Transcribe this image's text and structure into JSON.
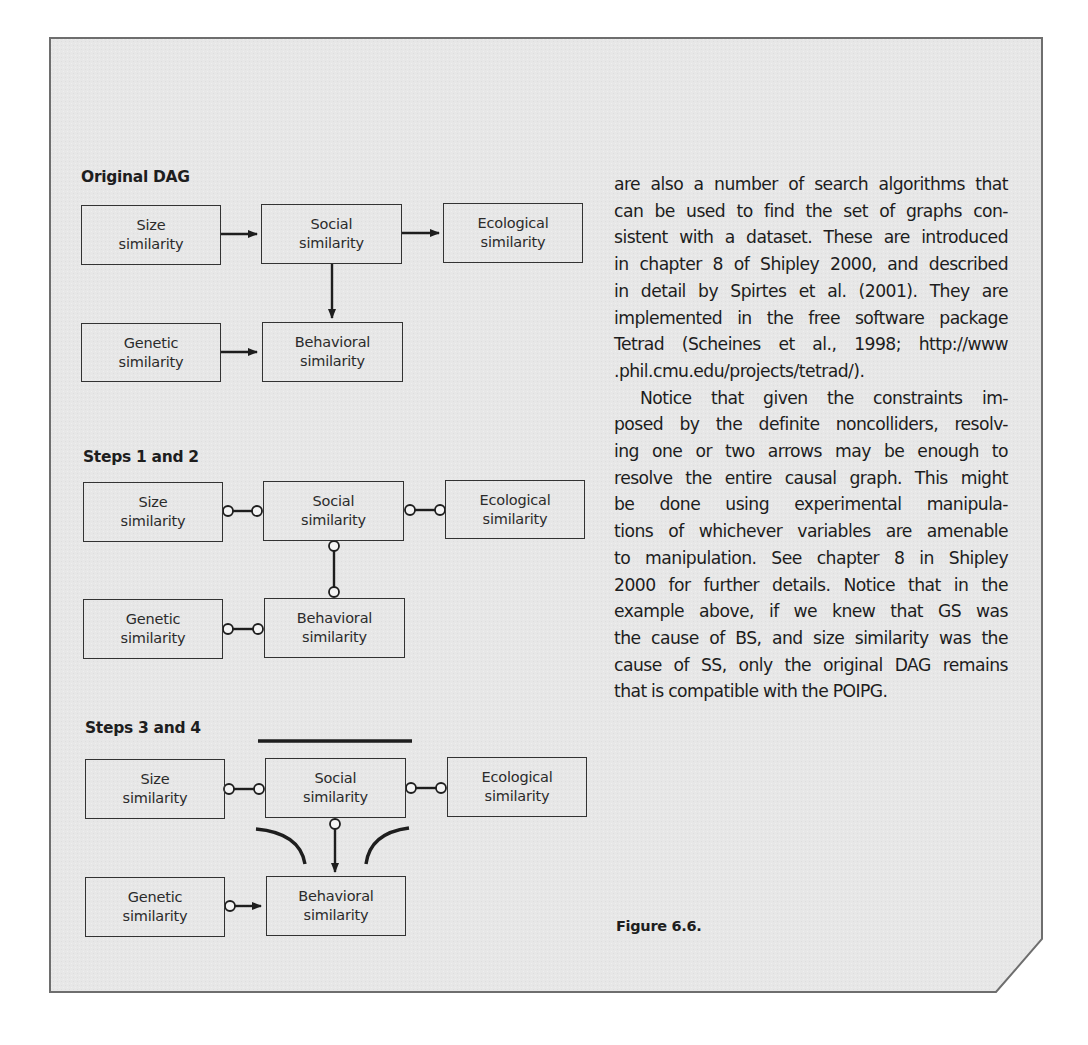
{
  "figure": {
    "caption": "Figure 6.6.",
    "panels": [
      {
        "title": "Original DAG",
        "nodes": {
          "size": [
            "Size",
            "similarity"
          ],
          "social": [
            "Social",
            "similarity"
          ],
          "ecological": [
            "Ecological",
            "similarity"
          ],
          "genetic": [
            "Genetic",
            "similarity"
          ],
          "behavioral": [
            "Behavioral",
            "similarity"
          ]
        },
        "edges": [
          {
            "from": "Size similarity",
            "to": "Social similarity",
            "type": "directed"
          },
          {
            "from": "Social similarity",
            "to": "Ecological similarity",
            "type": "directed"
          },
          {
            "from": "Social similarity",
            "to": "Behavioral similarity",
            "type": "directed"
          },
          {
            "from": "Genetic similarity",
            "to": "Behavioral similarity",
            "type": "directed"
          }
        ]
      },
      {
        "title": "Steps 1 and 2",
        "nodes": {
          "size": [
            "Size",
            "similarity"
          ],
          "social": [
            "Social",
            "similarity"
          ],
          "ecological": [
            "Ecological",
            "similarity"
          ],
          "genetic": [
            "Genetic",
            "similarity"
          ],
          "behavioral": [
            "Behavioral",
            "similarity"
          ]
        },
        "edges": [
          {
            "from": "Size similarity",
            "to": "Social similarity",
            "type": "circle-circle"
          },
          {
            "from": "Social similarity",
            "to": "Ecological similarity",
            "type": "circle-circle"
          },
          {
            "from": "Social similarity",
            "to": "Behavioral similarity",
            "type": "circle-circle"
          },
          {
            "from": "Genetic similarity",
            "to": "Behavioral similarity",
            "type": "circle-circle"
          }
        ]
      },
      {
        "title": "Steps 3 and 4",
        "nodes": {
          "size": [
            "Size",
            "similarity"
          ],
          "social": [
            "Social",
            "similarity"
          ],
          "ecological": [
            "Ecological",
            "similarity"
          ],
          "genetic": [
            "Genetic",
            "similarity"
          ],
          "behavioral": [
            "Behavioral",
            "similarity"
          ]
        },
        "edges": [
          {
            "from": "Size similarity",
            "to": "Social similarity",
            "type": "circle-circle"
          },
          {
            "from": "Social similarity",
            "to": "Ecological similarity",
            "type": "circle-circle"
          },
          {
            "from": "Social similarity",
            "to": "Behavioral similarity",
            "type": "circle-arrow"
          },
          {
            "from": "Genetic similarity",
            "to": "Behavioral similarity",
            "type": "circle-arrow"
          }
        ],
        "annotations": [
          "noncollider bar over Social similarity",
          "collider arcs around Behavioral similarity"
        ]
      }
    ]
  },
  "body_text": {
    "paragraph1_lines": [
      "are also a number of search algorithms that",
      "can be used to find the set of graphs con-",
      "sistent with a dataset. These are introduced",
      "in chapter 8 of Shipley 2000, and described",
      "in detail by Spirtes et al. (2001). They are",
      "implemented in the free software package",
      "Tetrad (Scheines et al., 1998; http://www",
      ".phil.cmu.edu/projects/tetrad/)."
    ],
    "paragraph2_lines": [
      "Notice that given the constraints im-",
      "posed by the definite noncolliders, resolv-",
      "ing one or two arrows may be enough to",
      "resolve the entire causal graph. This might",
      "be done using experimental manipula-",
      "tions of whichever variables are amenable",
      "to manipulation. See chapter 8 in Shipley",
      "2000 for further details. Notice that in the",
      "example above, if we knew that GS was",
      "the cause of BS, and size similarity was the",
      "cause of SS, only the original DAG remains",
      "that is compatible with the POIPG."
    ]
  },
  "colors": {
    "panel_background": "#e6e6e6",
    "panel_border": "#6e6e6e",
    "ink": "#222222"
  }
}
